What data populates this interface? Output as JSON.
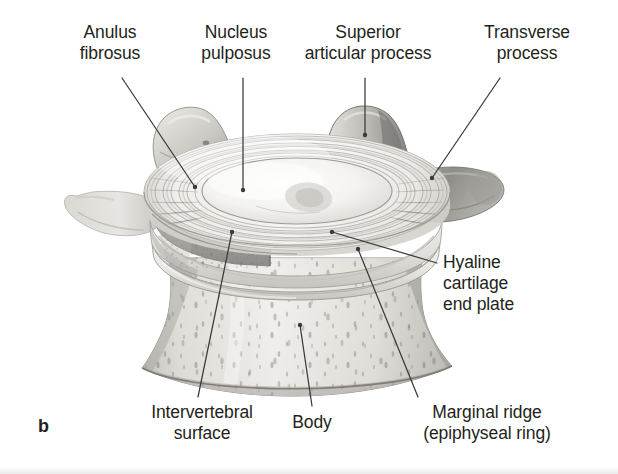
{
  "figure": {
    "panel_letter": "b",
    "title_implicit": "Lumbar vertebra with intervertebral disc, superior view",
    "background_color": "#ffffff",
    "ink_color": "#231f20",
    "leader_color": "#3a3a3a"
  },
  "labels": [
    {
      "id": "anulus-fibrosus",
      "text": "Anulus\nfibrosus",
      "align": "center",
      "x": 50,
      "y": 22,
      "width": 120,
      "leader": {
        "from_x": 122,
        "from_y": 78,
        "to_x": 195,
        "to_y": 187
      }
    },
    {
      "id": "nucleus-pulposus",
      "text": "Nucleus\npulposus",
      "align": "center",
      "x": 176,
      "y": 22,
      "width": 120,
      "leader": {
        "from_x": 243,
        "from_y": 78,
        "to_x": 243,
        "to_y": 190
      }
    },
    {
      "id": "superior-articular-process",
      "text": "Superior\narticular process",
      "align": "center",
      "x": 288,
      "y": 22,
      "width": 160,
      "leader": {
        "from_x": 365,
        "from_y": 78,
        "to_x": 365,
        "to_y": 135
      }
    },
    {
      "id": "transverse-process",
      "text": "Transverse\nprocess",
      "align": "center",
      "x": 462,
      "y": 22,
      "width": 130,
      "leader": {
        "from_x": 500,
        "from_y": 78,
        "to_x": 432,
        "to_y": 178
      }
    },
    {
      "id": "hyaline-cartilage-end-plate",
      "text": "Hyaline\ncartilage\nend plate",
      "align": "left",
      "x": 443,
      "y": 252,
      "width": 150,
      "leader": {
        "from_x": 437,
        "from_y": 263,
        "to_x": 332,
        "to_y": 232
      }
    },
    {
      "id": "intervertebral-surface",
      "text": "Intervertebral\nsurface",
      "align": "center",
      "x": 132,
      "y": 402,
      "width": 140,
      "leader": {
        "from_x": 198,
        "from_y": 397,
        "to_x": 232,
        "to_y": 232
      }
    },
    {
      "id": "body",
      "text": "Body",
      "align": "center",
      "x": 272,
      "y": 412,
      "width": 80,
      "leader": {
        "from_x": 312,
        "from_y": 406,
        "to_x": 300,
        "to_y": 325
      }
    },
    {
      "id": "marginal-ridge",
      "text": "Marginal ridge\n(epiphyseal ring)",
      "align": "center",
      "x": 392,
      "y": 402,
      "width": 190,
      "leader": {
        "from_x": 418,
        "from_y": 397,
        "to_x": 358,
        "to_y": 249
      }
    }
  ],
  "structures": [
    {
      "id": "disc",
      "name": "intervertebral disc"
    },
    {
      "id": "nucleus",
      "name": "nucleus pulposus"
    },
    {
      "id": "anulus",
      "name": "anulus fibrosus lamellae"
    },
    {
      "id": "vertebral-body",
      "name": "vertebral body"
    },
    {
      "id": "end-plate",
      "name": "hyaline cartilage end plate"
    },
    {
      "id": "marginal-ridge",
      "name": "marginal ridge / epiphyseal ring"
    },
    {
      "id": "cut-surface",
      "name": "intervertebral cut surface"
    },
    {
      "id": "sap-left",
      "name": "left superior articular process"
    },
    {
      "id": "sap-right",
      "name": "right superior articular process"
    },
    {
      "id": "tp-left",
      "name": "left transverse process"
    },
    {
      "id": "tp-right",
      "name": "right transverse process"
    }
  ]
}
